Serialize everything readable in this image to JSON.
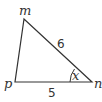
{
  "diagram": {
    "type": "triangle",
    "vertices": {
      "m": {
        "label": "m",
        "x": 24,
        "y": 19
      },
      "p": {
        "label": "p",
        "x": 15,
        "y": 82
      },
      "n": {
        "label": "n",
        "x": 92,
        "y": 82
      }
    },
    "sides": {
      "mn": {
        "label": "6"
      },
      "pn": {
        "label": "5"
      }
    },
    "angle": {
      "vertex": "n",
      "label": "x"
    },
    "colors": {
      "stroke": "#333333",
      "background": "#ffffff"
    }
  }
}
